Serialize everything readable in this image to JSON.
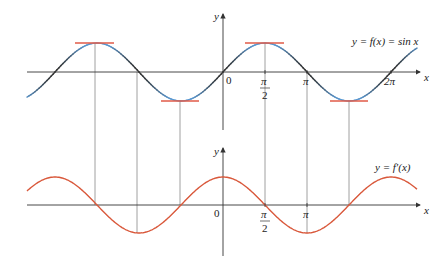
{
  "top_graph": {
    "y_label": "y",
    "x_label": "x",
    "origin_label": "0",
    "curve_label": "y = f(x) = sin x",
    "ticks": [
      {
        "num": "π",
        "den": "2"
      },
      {
        "num": "π",
        "den": ""
      },
      {
        "num": "2π",
        "den": ""
      }
    ],
    "curve_color": "#5b9bd5",
    "steep_color": "#333333",
    "tangent_color": "#e05a47"
  },
  "bottom_graph": {
    "y_label": "y",
    "x_label": "x",
    "origin_label": "0",
    "curve_label": "y = f′(x)",
    "ticks": [
      {
        "num": "π",
        "den": "2"
      },
      {
        "num": "π",
        "den": ""
      }
    ],
    "curve_color": "#d9583b"
  },
  "chart_data": {
    "type": "line",
    "title": "",
    "series": [
      {
        "name": "f(x) = sin x",
        "function": "sin(x)",
        "x_range": [
          -4.71,
          7.1
        ]
      },
      {
        "name": "f'(x) = cos x",
        "function": "cos(x)",
        "x_range": [
          -4.71,
          7.1
        ]
      }
    ],
    "x_ticks": [
      "0",
      "π/2",
      "π",
      "2π"
    ],
    "horizontal_tangents_at": [
      "-3π/2",
      "-π/2",
      "π/2",
      "3π/2"
    ],
    "xlabel": "x",
    "ylabel": "y"
  }
}
